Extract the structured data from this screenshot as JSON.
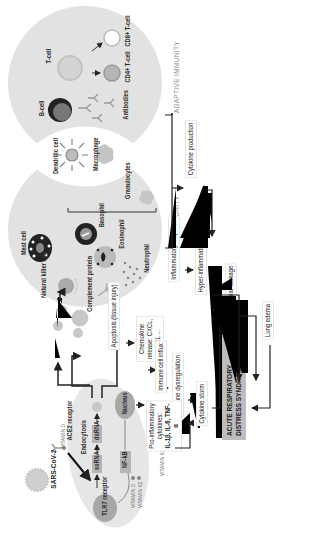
{
  "diagram": {
    "sections": {
      "adaptive": "ADAPTIVE IMMUNITY",
      "innate": "INNATE IMMUNITY"
    },
    "adaptive_cells": {
      "t_cell": "T-cell",
      "cd8": "CD8+ T-cell",
      "cd4": "CD4+ T-cell",
      "b_cell": "B-cell",
      "antibodies": "Antibodies"
    },
    "overlap_cells": {
      "dendritic": "Dendritic cell",
      "macrophage": "Macrophage"
    },
    "innate_cells": {
      "mast": "Mast cell",
      "nk": "Natural killer cell",
      "complement": "Complement protein",
      "granulocytes": "Granulocytes",
      "basophil": "Basophil",
      "eosinophil": "Eosinophil",
      "neutrophil": "Neutrophil"
    },
    "infection": {
      "virus": "SARS-CoV-2",
      "ace2": "ACE2 receptor",
      "vitamin_d_top": "VITAMIN D",
      "endocytosis": "Endocytosis",
      "ssrna": "ssRNA",
      "dsrna": "dsRNA",
      "tlr7": "TLR7 receptor",
      "nucleus": "Nucleus",
      "nfkb": "NF-kB",
      "vitamin_d_bottom": "VITAMIN D",
      "vitamin_k2_bottom": "VITAMIN K2",
      "vitamin_k2_side": "VITAMIN K2"
    },
    "flow": {
      "apoptosis": "Apoptosis (tissue injury)",
      "chemokine": "Chemokine release: CXCL, CCL ...",
      "immune_influx": "Immune cell influx",
      "immune_dysreg": "Immune dysregulation",
      "cytokine_storm": "Cytokine storm",
      "pro_inflam_1": "Pro-inflammatory",
      "pro_inflam_2": "cytokines:",
      "pro_inflam_3": "IL-1β, IL-6, TNF-α",
      "cytokine_production": "Cytokine production",
      "inflammatory_response": "Inflammatory response",
      "hyper_inflammation": "Hyper-inflammation",
      "vascular_leakage": "Vascular leakage",
      "lung_edema": "Lung edema",
      "ards_line1": "ACUTE RESPIRATORY",
      "ards_line2": "DISTRESS SYNDROME (ARDS)"
    },
    "colors": {
      "circle_fill": "#e2e2e2",
      "cell_fill": "#e6e6e6",
      "dark_node": "#a8a8a8",
      "ards_fill": "#bdbdbd",
      "arrow": "#222222"
    }
  }
}
